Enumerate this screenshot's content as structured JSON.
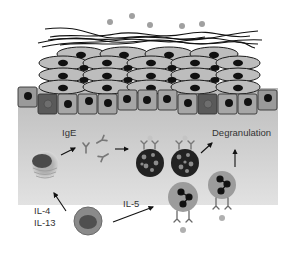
{
  "diagram": {
    "colors": {
      "background": "#ffffff",
      "tissue": "#c8c8c8",
      "tissue_light": "#d8d8d8",
      "cell_fill": "#bdbdbd",
      "cell_stroke": "#1a1a1a",
      "nucleus": "#111111",
      "basal_cell": "#9a9a9a",
      "basal_cell_dark": "#5a5a5a",
      "particle": "#a0a0a0",
      "mast_cell": "#222222",
      "granule": "#8c8c8c",
      "eosinophil": "#9c9c9c",
      "text": "#333333"
    },
    "labels": {
      "ige": "IgE",
      "degranulation": "Degranulation",
      "il4": "IL-4",
      "il13": "IL-13",
      "il5": "IL-5"
    },
    "layers": [
      "mucus-fibers",
      "stratified-squamous-epithelium",
      "basal-cell-layer",
      "lamina-propria"
    ],
    "cells": [
      {
        "id": "b-cell",
        "description": "B cell / plasma cell producing IgE"
      },
      {
        "id": "ige-antibodies",
        "description": "free IgE antibodies"
      },
      {
        "id": "mast-cell-1",
        "description": "mast cell with bound IgE"
      },
      {
        "id": "mast-cell-2",
        "description": "mast cell with bound IgE"
      },
      {
        "id": "t-cell",
        "description": "Th2 T cell"
      },
      {
        "id": "eosinophil-1",
        "description": "eosinophil"
      },
      {
        "id": "eosinophil-2",
        "description": "eosinophil"
      }
    ]
  }
}
